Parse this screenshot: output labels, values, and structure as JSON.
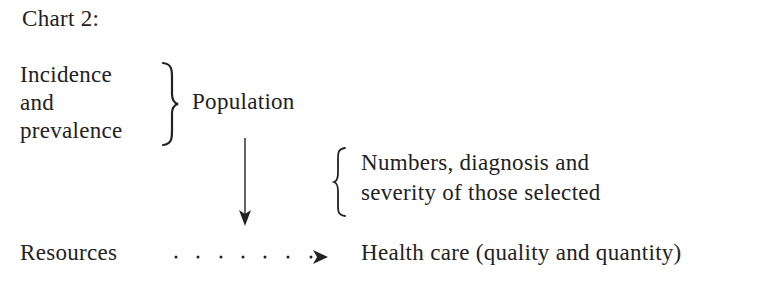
{
  "title": "Chart 2:",
  "left_group": {
    "lines": [
      "Incidence",
      "and",
      "prevalence"
    ]
  },
  "population_label": "Population",
  "selection_group": {
    "lines": [
      "Numbers, diagnosis and",
      "severity of those selected"
    ]
  },
  "resources_label": "Resources",
  "health_care_label": "Health care (quality and quantity)",
  "connectors": {
    "left_group_to_population": "right-brace",
    "selection_group_bracket": "left-brace",
    "population_to_resources": "solid-arrow-down",
    "resources_to_health_care": "dotted-arrow-right"
  },
  "colors": {
    "text": "#222222",
    "background": "#ffffff"
  }
}
